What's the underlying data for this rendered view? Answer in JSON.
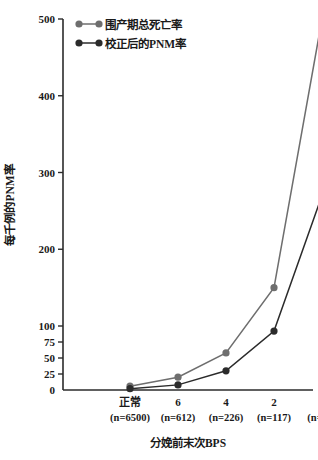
{
  "chart_data": {
    "type": "line",
    "title": "",
    "xlabel": "分娩前末次BPS",
    "ylabel": "每千例的PNM率",
    "categories": [
      "正常",
      "6",
      "4",
      "2",
      "0"
    ],
    "category_counts": [
      "(n=6500)",
      "(n=612)",
      "(n=226)",
      "(n=117)",
      "(n=28)"
    ],
    "yticks": [
      0,
      25,
      50,
      75,
      100,
      200,
      300,
      400,
      500
    ],
    "ytick_labels": [
      "0",
      "25",
      "50",
      "75",
      "100",
      "200",
      "300",
      "400",
      "500"
    ],
    "ylim": [
      0,
      500
    ],
    "grid": false,
    "legend_position": "top-left",
    "series": [
      {
        "name": "围产期总死亡率",
        "color": "#6e6e6e",
        "values": [
          6,
          20,
          58,
          150,
          500
        ]
      },
      {
        "name": "校正后的PNM率",
        "color": "#2b2b2b",
        "values": [
          2,
          8,
          30,
          92,
          270
        ]
      }
    ]
  },
  "axes": {
    "y_title": "每千例的PNM率",
    "x_title": "分娩前末次BPS"
  },
  "legend": {
    "entries": [
      {
        "label": "围产期总死亡率",
        "color": "#6e6e6e"
      },
      {
        "label": "校正后的PNM率",
        "color": "#2b2b2b"
      }
    ]
  }
}
